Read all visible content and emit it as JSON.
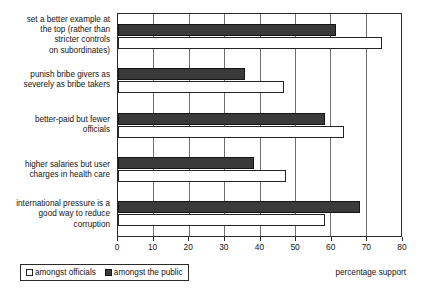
{
  "chart_data": {
    "type": "bar",
    "orientation": "horizontal",
    "title": "",
    "xlabel": "percentage support",
    "ylabel": "",
    "xlim": [
      0,
      80
    ],
    "xticks": [
      0,
      10,
      20,
      30,
      40,
      50,
      60,
      70,
      80
    ],
    "grid": true,
    "legend_position": "bottom-left",
    "categories": [
      "set a better example at the top (rather than stricter controls on subordinates)",
      "punish bribe givers as severely as bribe takers",
      "better-paid but fewer officials",
      "higher salaries but user charges in health care",
      "international pressure is a good way to reduce corruption"
    ],
    "category_lines": [
      [
        "set a better example at",
        "the top (rather than",
        "stricter controls",
        "on subordinates)"
      ],
      [
        "punish bribe givers as",
        "severely as bribe takers"
      ],
      [
        "better-paid but fewer",
        "officials"
      ],
      [
        "higher salaries but user",
        "charges in health care"
      ],
      [
        "international pressure is a",
        "good way to reduce",
        "corruption"
      ]
    ],
    "series": [
      {
        "name": "amongst the public",
        "color": "#3a3a3a",
        "values": [
          61.5,
          36,
          58.5,
          38.5,
          68.5
        ]
      },
      {
        "name": "amongst officials",
        "color": "#ffffff",
        "values": [
          74.5,
          47,
          64,
          47.5,
          58.5
        ]
      }
    ]
  },
  "legend": {
    "entries": [
      {
        "label": "amongst officials",
        "swatch": "white-square-icon"
      },
      {
        "label": "amongst the public",
        "swatch": "black-square-icon"
      }
    ]
  },
  "axis": {
    "title": "percentage support",
    "tick_labels": [
      "0",
      "10",
      "20",
      "30",
      "40",
      "50",
      "60",
      "70",
      "80"
    ]
  }
}
